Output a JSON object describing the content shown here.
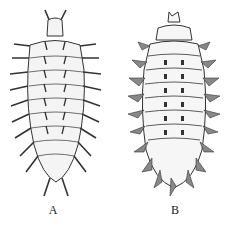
{
  "figure": {
    "panels": [
      {
        "label": "A",
        "subject": "larva-spiny-segmented"
      },
      {
        "label": "B",
        "subject": "larva-tuberculate-segmented"
      }
    ]
  }
}
